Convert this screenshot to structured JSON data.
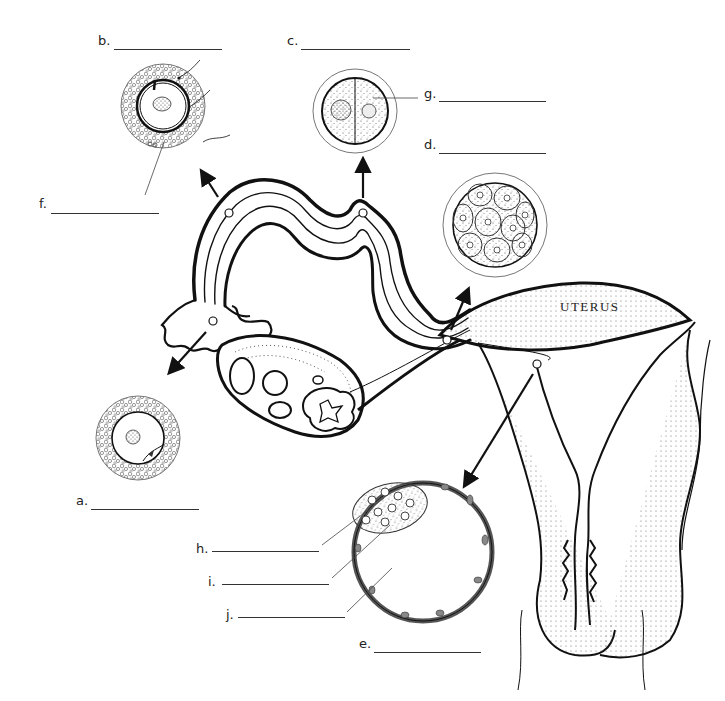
{
  "organ_label": "UTERUS",
  "labels": [
    {
      "id": "a",
      "text": "a.",
      "x": 76,
      "y": 501,
      "line_x": 91,
      "line_w": 108
    },
    {
      "id": "b",
      "text": "b.",
      "x": 98,
      "y": 41,
      "line_x": 114,
      "line_w": 108
    },
    {
      "id": "c",
      "text": "c.",
      "x": 287,
      "y": 41,
      "line_x": 301,
      "line_w": 109
    },
    {
      "id": "d",
      "text": "d.",
      "x": 424,
      "y": 145,
      "line_x": 439,
      "line_w": 107
    },
    {
      "id": "e",
      "text": "e.",
      "x": 359,
      "y": 644,
      "line_x": 374,
      "line_w": 107
    },
    {
      "id": "f",
      "text": "f.",
      "x": 39,
      "y": 204,
      "line_x": 51,
      "line_w": 108
    },
    {
      "id": "g",
      "text": "g.",
      "x": 424,
      "y": 92,
      "line_x": 439,
      "line_w": 107
    },
    {
      "id": "h",
      "text": "h.",
      "x": 196,
      "y": 541,
      "line_x": 212,
      "line_w": 107
    },
    {
      "id": "i",
      "text": "i.",
      "x": 208,
      "y": 575,
      "line_x": 222,
      "line_w": 107
    },
    {
      "id": "j",
      "text": "j.",
      "x": 226,
      "y": 608,
      "line_x": 238,
      "line_w": 107
    }
  ],
  "structures": [
    {
      "name": "secondary-oocyte",
      "label": "a"
    },
    {
      "name": "fertilization",
      "label": "b"
    },
    {
      "name": "two-cell-zygote",
      "label": "c"
    },
    {
      "name": "morula",
      "label": "d"
    },
    {
      "name": "blastocyst",
      "label": "e"
    },
    {
      "name": "zygote-nucleus",
      "label": "f"
    },
    {
      "name": "blastomere",
      "label": "g"
    },
    {
      "name": "inner-cell-mass",
      "label": "h"
    },
    {
      "name": "trophoblast",
      "label": "i"
    },
    {
      "name": "blastocoel",
      "label": "j"
    }
  ],
  "colors": {
    "ink": "#111111",
    "stipple": "#555555",
    "background": "#ffffff"
  }
}
